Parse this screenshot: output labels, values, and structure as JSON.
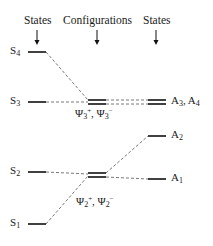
{
  "headers": {
    "left": "States",
    "middle": "Configurations",
    "right": "States"
  },
  "left_states": [
    {
      "name": "S",
      "sub": "4"
    },
    {
      "name": "S",
      "sub": "3"
    },
    {
      "name": "S",
      "sub": "2"
    },
    {
      "name": "S",
      "sub": "1"
    }
  ],
  "configurations": [
    {
      "label": "Ψ₃⁺, Ψ₃⁻",
      "psi": "Ψ",
      "sub": "3",
      "plus": "+",
      "minus": "−",
      "sep": ", "
    },
    {
      "label": "Ψ₂⁺, Ψ₂⁻",
      "psi": "Ψ",
      "sub": "2",
      "plus": "+",
      "minus": "−",
      "sep": ", "
    }
  ],
  "right_states": [
    {
      "label": "A₃, A₄",
      "name": "A",
      "sub": "3",
      "sep": ", ",
      "name2": "A",
      "sub2": "4"
    },
    {
      "label": "A₂",
      "name": "A",
      "sub": "2"
    },
    {
      "label": "A₁",
      "name": "A",
      "sub": "1"
    }
  ],
  "colors": {
    "line": "#111111",
    "dashed": "#555555",
    "background": "#ffffff"
  }
}
